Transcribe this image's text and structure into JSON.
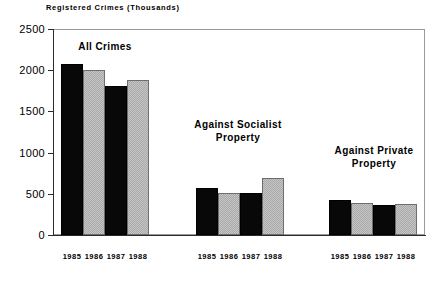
{
  "chart_data": {
    "type": "bar",
    "title": "Registered Crimes (Thousands)",
    "xlabel": "",
    "ylabel": "",
    "ylim": [
      0,
      2500
    ],
    "yticks": [
      0,
      500,
      1000,
      1500,
      2000,
      2500
    ],
    "ytick_labels": [
      "0",
      "500",
      "1000",
      "1500",
      "2000",
      "2500"
    ],
    "grid": false,
    "legend": "none",
    "categories": [
      "1985",
      "1986",
      "1987",
      "1988"
    ],
    "groups": [
      {
        "name": "All Crimes",
        "label_lines": "All Crimes",
        "values": [
          2080,
          2000,
          1810,
          1880
        ]
      },
      {
        "name": "Against Socialist Property",
        "label_lines": "Against Socialist\nProperty",
        "values": [
          570,
          510,
          510,
          690
        ]
      },
      {
        "name": "Against Private Property",
        "label_lines": "Against Private\nProperty",
        "values": [
          430,
          385,
          370,
          380
        ]
      }
    ],
    "bar_colors": [
      "#080808",
      "#a9a9a9",
      "#080808",
      "#a9a9a9"
    ],
    "colors": {
      "dark_bar": "#080808",
      "light_bar": "#a9a9a9",
      "axis": "#2b2b2b",
      "frame": "#9a9a9a",
      "background": "#ffffff",
      "text": "#000000"
    },
    "axis_labels_x": [
      "1985",
      "1986",
      "1987",
      "1988",
      "1985",
      "1986",
      "1987",
      "1988",
      "1985",
      "1986",
      "1987",
      "1988"
    ]
  }
}
